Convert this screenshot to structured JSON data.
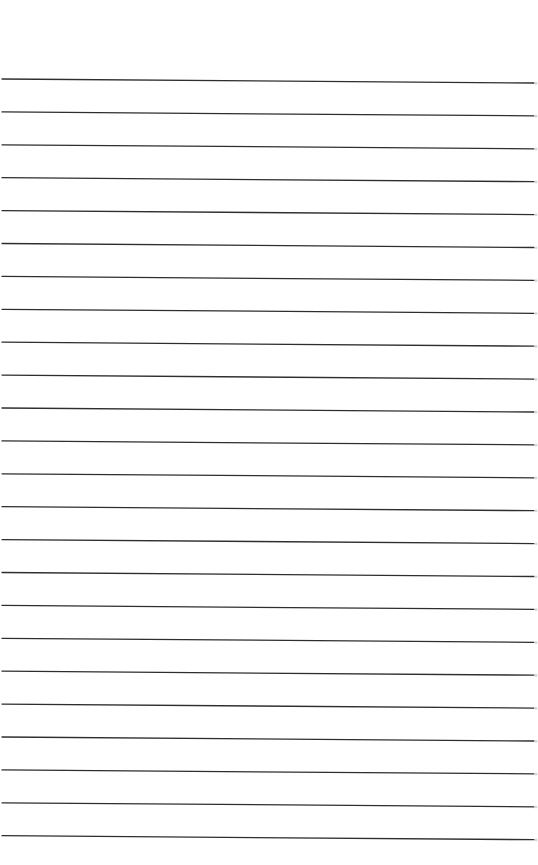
{
  "page": {
    "type": "blank ruled paper",
    "background_color": "#ffffff",
    "text_content": ""
  },
  "rules": {
    "count": 24,
    "line_color": "#2e2e2e",
    "end_mark_color": "#d6d6d6",
    "line_thickness": 1.3,
    "x_start": 2,
    "x_end": 534,
    "first_line_y_left": 79,
    "first_line_y_right": 83,
    "spacing": 32.9,
    "slope_drop_px": 4
  }
}
